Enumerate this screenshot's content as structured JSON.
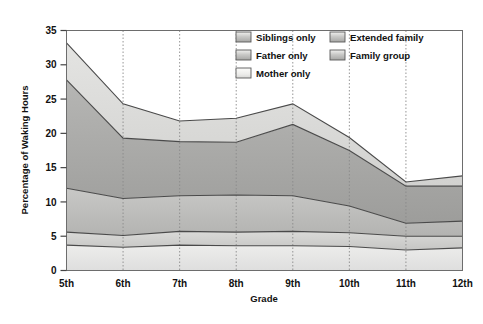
{
  "chart_data": {
    "type": "area",
    "stacked": true,
    "title": "",
    "xlabel": "Grade",
    "ylabel": "Percentage of Waking Hours",
    "categories": [
      "5th",
      "6th",
      "7th",
      "8th",
      "9th",
      "10th",
      "11th",
      "12th"
    ],
    "ylim": [
      0,
      35
    ],
    "yticks": [
      0,
      5,
      10,
      15,
      20,
      25,
      30,
      35
    ],
    "grid": "vertical-dotted",
    "legend_position": "top-right-inside",
    "series": [
      {
        "name": "Mother only",
        "color": "#e8e8e6",
        "cumulative": [
          3.7,
          3.4,
          3.7,
          3.6,
          3.6,
          3.5,
          3.0,
          3.3
        ],
        "values": [
          3.7,
          3.4,
          3.7,
          3.6,
          3.6,
          3.5,
          3.0,
          3.3
        ]
      },
      {
        "name": "Father only",
        "color": "#d2d2d0",
        "cumulative": [
          5.6,
          5.1,
          5.7,
          5.6,
          5.7,
          5.5,
          5.0,
          5.0
        ],
        "values": [
          1.9,
          1.7,
          2.0,
          2.0,
          2.1,
          2.0,
          2.0,
          1.7
        ]
      },
      {
        "name": "Siblings only",
        "color": "#bfbfbd",
        "cumulative": [
          12.0,
          10.5,
          10.9,
          11.0,
          10.9,
          9.4,
          6.9,
          7.2
        ],
        "values": [
          6.4,
          5.4,
          5.2,
          5.4,
          5.2,
          3.9,
          1.9,
          2.2
        ]
      },
      {
        "name": "Family group",
        "color": "#a9a9a7",
        "cumulative": [
          27.8,
          19.3,
          18.8,
          18.7,
          21.3,
          17.5,
          12.3,
          12.3
        ],
        "values": [
          15.8,
          8.8,
          7.9,
          7.7,
          10.4,
          8.1,
          5.4,
          5.1
        ]
      },
      {
        "name": "Extended family",
        "color": "#dcdcda",
        "cumulative": [
          33.2,
          24.3,
          21.8,
          22.2,
          24.3,
          19.4,
          12.9,
          13.8
        ],
        "values": [
          5.4,
          5.0,
          3.0,
          3.5,
          3.0,
          1.9,
          0.6,
          1.5
        ]
      }
    ],
    "legend_items": [
      {
        "label": "Siblings only",
        "swatch": "#bfbfbd"
      },
      {
        "label": "Extended family",
        "swatch": "#dcdcda"
      },
      {
        "label": "Father only",
        "swatch": "#d2d2d0"
      },
      {
        "label": "Family group",
        "swatch": "#a9a9a7"
      },
      {
        "label": "Mother only",
        "swatch": "#e8e8e6"
      }
    ],
    "colors": {
      "plot_border": "#6d6d6d",
      "grid": "#8a8a8a",
      "line": "#4a4a4a",
      "background": "#ffffff"
    }
  }
}
